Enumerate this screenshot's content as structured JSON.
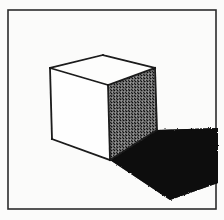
{
  "figure": {
    "title": "Shaded cube with cast shadow",
    "medium": "pen and ink line drawing, halftone scan",
    "canvas": {
      "width": 224,
      "height": 220
    },
    "colors": {
      "page_background": "#fbfbfa",
      "frame_stroke": "#2b2b2b",
      "outline_stroke": "#1a1a1a",
      "top_face_fill": "#fdfdfc",
      "left_face_fill": "#fefefe",
      "right_face_fill": "#6e6e6e",
      "shadow_fill": "#0b0b0b",
      "stipple_dark": "#141414",
      "stipple_light": "#c9c9c9"
    },
    "frame": {
      "name": "border-frame",
      "x": 8,
      "y": 10,
      "width": 208,
      "height": 199,
      "stroke_width": 1.6
    },
    "cube": {
      "name": "cube",
      "vertices": {
        "top_back": {
          "x": 103,
          "y": 55
        },
        "top_left": {
          "x": 50,
          "y": 68
        },
        "top_right": {
          "x": 155,
          "y": 68
        },
        "top_front": {
          "x": 108,
          "y": 85
        },
        "bottom_left": {
          "x": 52,
          "y": 139
        },
        "bottom_front": {
          "x": 110,
          "y": 160
        },
        "bottom_right": {
          "x": 157,
          "y": 130
        }
      },
      "faces": [
        {
          "name": "top-face",
          "shading": "white",
          "polygon": "103,55 155,68 108,85 50,68"
        },
        {
          "name": "left-face",
          "shading": "white",
          "polygon": "50,68 108,85 110,160 52,139"
        },
        {
          "name": "right-face",
          "shading": "stippled-dark",
          "polygon": "108,85 155,68 157,130 110,160"
        }
      ]
    },
    "shadow": {
      "name": "cast-shadow",
      "polygon": "110,160 157,130 218,128 218,183 170,200",
      "direction": "lower-right"
    }
  }
}
